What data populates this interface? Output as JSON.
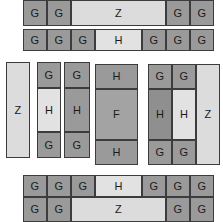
{
  "diagram": {
    "type": "block-grid",
    "canvas": {
      "width": 223,
      "height": 222,
      "background": "#ffffff"
    },
    "palette": {
      "G": "#9a9a9a",
      "Z": "#dcdcdc",
      "H_light": "#e2e2e2",
      "H_mid": "#9a9a9a",
      "H_dark": "#8f8f8f",
      "F": "#a3a3a3",
      "outline": "#3c3c3c",
      "text": "#1a1a1a"
    },
    "groups": [
      {
        "name": "top-row-1",
        "blocks": [
          {
            "label": "G",
            "tone": "G",
            "x": 23,
            "y": 0,
            "w": 24,
            "h": 26
          },
          {
            "label": "G",
            "tone": "G",
            "x": 47,
            "y": 0,
            "w": 24,
            "h": 26
          },
          {
            "label": "Z",
            "tone": "Z",
            "x": 71,
            "y": 0,
            "w": 95,
            "h": 26
          },
          {
            "label": "G",
            "tone": "G",
            "x": 166,
            "y": 0,
            "w": 24,
            "h": 26
          },
          {
            "label": "G",
            "tone": "G",
            "x": 190,
            "y": 0,
            "w": 24,
            "h": 26
          }
        ]
      },
      {
        "name": "top-row-2",
        "blocks": [
          {
            "label": "G",
            "tone": "G",
            "x": 23,
            "y": 29,
            "w": 24,
            "h": 22
          },
          {
            "label": "G",
            "tone": "G",
            "x": 47,
            "y": 29,
            "w": 24,
            "h": 22
          },
          {
            "label": "G",
            "tone": "G",
            "x": 71,
            "y": 29,
            "w": 24,
            "h": 22
          },
          {
            "label": "H",
            "tone": "H_light",
            "x": 95,
            "y": 29,
            "w": 47,
            "h": 22
          },
          {
            "label": "G",
            "tone": "G",
            "x": 142,
            "y": 29,
            "w": 24,
            "h": 22
          },
          {
            "label": "G",
            "tone": "G",
            "x": 166,
            "y": 29,
            "w": 24,
            "h": 22
          },
          {
            "label": "G",
            "tone": "G",
            "x": 190,
            "y": 29,
            "w": 24,
            "h": 22
          }
        ]
      },
      {
        "name": "middle-column-z",
        "blocks": [
          {
            "label": "Z",
            "tone": "Z",
            "x": 6,
            "y": 62,
            "w": 24,
            "h": 96
          }
        ]
      },
      {
        "name": "middle-column-ghg-light",
        "blocks": [
          {
            "label": "G",
            "tone": "G",
            "x": 37,
            "y": 62,
            "w": 24,
            "h": 26
          },
          {
            "label": "H",
            "tone": "H_light",
            "x": 37,
            "y": 88,
            "w": 24,
            "h": 44
          },
          {
            "label": "G",
            "tone": "G",
            "x": 37,
            "y": 132,
            "w": 24,
            "h": 26
          }
        ]
      },
      {
        "name": "middle-column-ghg-dark",
        "blocks": [
          {
            "label": "G",
            "tone": "G",
            "x": 64,
            "y": 62,
            "w": 26,
            "h": 26
          },
          {
            "label": "H",
            "tone": "H_mid",
            "x": 64,
            "y": 88,
            "w": 26,
            "h": 44
          },
          {
            "label": "G",
            "tone": "G",
            "x": 64,
            "y": 132,
            "w": 26,
            "h": 26
          }
        ]
      },
      {
        "name": "middle-column-hfh",
        "blocks": [
          {
            "label": "H",
            "tone": "H_mid",
            "x": 95,
            "y": 64,
            "w": 43,
            "h": 25
          },
          {
            "label": "F",
            "tone": "F",
            "x": 95,
            "y": 89,
            "w": 43,
            "h": 51
          },
          {
            "label": "H",
            "tone": "H_mid",
            "x": 95,
            "y": 140,
            "w": 43,
            "h": 25
          }
        ]
      },
      {
        "name": "middle-cluster-right",
        "blocks": [
          {
            "label": "G",
            "tone": "G",
            "x": 148,
            "y": 64,
            "w": 24,
            "h": 25
          },
          {
            "label": "G",
            "tone": "G",
            "x": 172,
            "y": 64,
            "w": 24,
            "h": 25
          },
          {
            "label": "H",
            "tone": "H_dark",
            "x": 148,
            "y": 89,
            "w": 24,
            "h": 51
          },
          {
            "label": "H",
            "tone": "H_light",
            "x": 172,
            "y": 89,
            "w": 24,
            "h": 51
          },
          {
            "label": "G",
            "tone": "G",
            "x": 148,
            "y": 140,
            "w": 24,
            "h": 25
          },
          {
            "label": "G",
            "tone": "G",
            "x": 172,
            "y": 140,
            "w": 24,
            "h": 25
          },
          {
            "label": "Z",
            "tone": "Z",
            "x": 196,
            "y": 64,
            "w": 24,
            "h": 101
          }
        ]
      },
      {
        "name": "bottom-row-1",
        "blocks": [
          {
            "label": "G",
            "tone": "G",
            "x": 23,
            "y": 175,
            "w": 24,
            "h": 22
          },
          {
            "label": "G",
            "tone": "G",
            "x": 47,
            "y": 175,
            "w": 24,
            "h": 22
          },
          {
            "label": "G",
            "tone": "G",
            "x": 71,
            "y": 175,
            "w": 24,
            "h": 22
          },
          {
            "label": "H",
            "tone": "H_light",
            "x": 95,
            "y": 175,
            "w": 47,
            "h": 22
          },
          {
            "label": "G",
            "tone": "G",
            "x": 142,
            "y": 175,
            "w": 24,
            "h": 22
          },
          {
            "label": "G",
            "tone": "G",
            "x": 166,
            "y": 175,
            "w": 24,
            "h": 22
          },
          {
            "label": "G",
            "tone": "G",
            "x": 190,
            "y": 175,
            "w": 24,
            "h": 22
          }
        ]
      },
      {
        "name": "bottom-row-2",
        "blocks": [
          {
            "label": "G",
            "tone": "G",
            "x": 23,
            "y": 197,
            "w": 24,
            "h": 25
          },
          {
            "label": "G",
            "tone": "G",
            "x": 47,
            "y": 197,
            "w": 24,
            "h": 25
          },
          {
            "label": "Z",
            "tone": "Z",
            "x": 71,
            "y": 197,
            "w": 95,
            "h": 25
          },
          {
            "label": "G",
            "tone": "G",
            "x": 166,
            "y": 197,
            "w": 24,
            "h": 25
          },
          {
            "label": "G",
            "tone": "G",
            "x": 190,
            "y": 197,
            "w": 24,
            "h": 25
          }
        ]
      }
    ]
  }
}
